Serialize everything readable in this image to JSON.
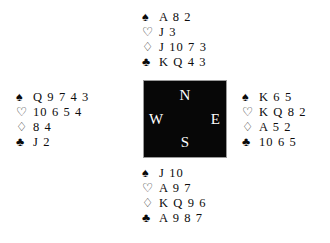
{
  "diagram": {
    "type": "bridge-deal-diagram",
    "suit_symbols": {
      "spade": "♠",
      "heart": "♡",
      "diamond": "♢",
      "club": "♣"
    },
    "compass": {
      "north_label": "N",
      "west_label": "W",
      "east_label": "E",
      "south_label": "S",
      "background_color": "#070707",
      "text_color": "#ffffff"
    },
    "hands": {
      "north": {
        "position_label": "North",
        "spades": "A 8 2",
        "hearts": "J 3",
        "diamonds": "J 10 7 3",
        "clubs": "K Q 4 3"
      },
      "west": {
        "position_label": "West",
        "spades": "Q 9 7 4 3",
        "hearts": "10 6 5 4",
        "diamonds": "8 4",
        "clubs": "J 2"
      },
      "east": {
        "position_label": "East",
        "spades": "K 6 5",
        "hearts": "K Q 8 2",
        "diamonds": "A 5 2",
        "clubs": "10 6 5"
      },
      "south": {
        "position_label": "South",
        "spades": "J 10",
        "hearts": "A 9 7",
        "diamonds": "K Q 9 6",
        "clubs": "A 9 8 7"
      }
    }
  }
}
